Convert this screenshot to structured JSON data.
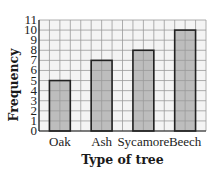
{
  "chart_data": {
    "type": "bar",
    "title": "",
    "xlabel": "Type of tree",
    "ylabel": "Frequency",
    "categories": [
      "Oak",
      "Ash",
      "Sycamore",
      "Beech"
    ],
    "values": [
      5,
      7,
      8,
      10
    ],
    "ylim": [
      0,
      11
    ],
    "yticks": [
      0,
      1,
      2,
      3,
      4,
      5,
      6,
      7,
      8,
      9,
      10,
      11
    ],
    "grid": true,
    "legend": null,
    "colors": {
      "bar_fill": "#bdbdbd",
      "bar_edge": "#222222",
      "grid": "#9a9a9a",
      "plot_bg": "#f4f4f4"
    }
  }
}
